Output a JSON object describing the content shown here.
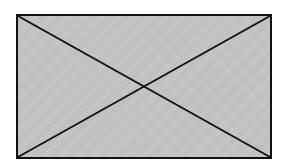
{
  "placeholder": {
    "kind": "image-placeholder",
    "fill_color": "#c6c6c6",
    "stroke_color": "#111111"
  }
}
